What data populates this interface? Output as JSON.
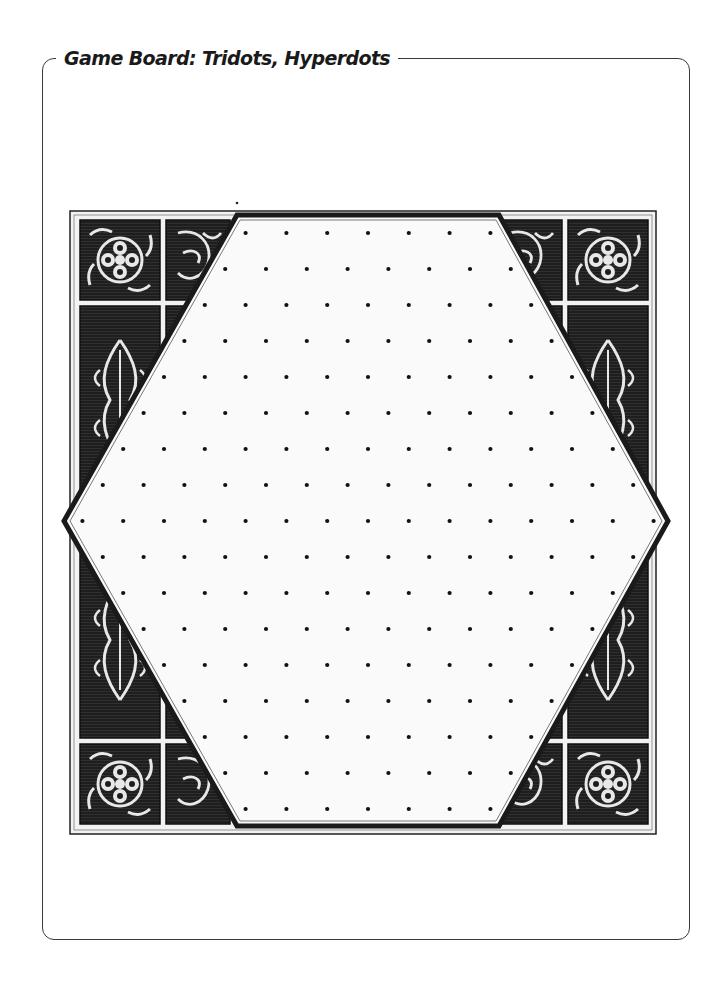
{
  "page": {
    "title": "Game Board: Tridots, Hyperdots"
  },
  "board": {
    "shape": "hexagon",
    "frame": "ornamental-engraved-tile-border",
    "grid": "triangular-dot-lattice",
    "row_dot_counts": [
      7,
      8,
      9,
      10,
      11,
      12,
      13,
      14,
      15,
      14,
      13,
      12,
      11,
      10,
      9,
      8,
      7
    ],
    "total_rows": 17,
    "total_dots": 187,
    "colors": {
      "dot": "#111111",
      "hex_outline": "#1a1a1a",
      "board_fill": "#fafafa",
      "tile_dark": "#1e1e1e",
      "tile_light": "#e8e8e8",
      "card_border": "#3a3a3a"
    }
  }
}
